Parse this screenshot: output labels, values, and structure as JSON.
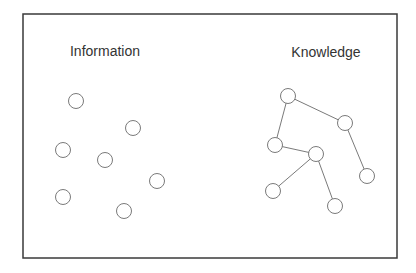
{
  "colors": {
    "frame": "#3a3a3a",
    "node": "#7a7a7a",
    "edge": "#7a7a7a",
    "text": "#333333"
  },
  "panels": {
    "information": {
      "label": "Information",
      "nodes": [
        [
          76,
          101
        ],
        [
          133,
          128
        ],
        [
          63,
          150
        ],
        [
          105,
          160
        ],
        [
          157,
          181
        ],
        [
          63,
          197
        ],
        [
          124,
          211
        ]
      ]
    },
    "knowledge": {
      "label": "Knowledge",
      "nodes": [
        [
          288,
          96
        ],
        [
          345,
          123
        ],
        [
          275,
          145
        ],
        [
          316,
          154
        ],
        [
          367,
          176
        ],
        [
          273,
          191
        ],
        [
          335,
          206
        ]
      ],
      "edges": [
        [
          0,
          1
        ],
        [
          0,
          2
        ],
        [
          1,
          4
        ],
        [
          2,
          3
        ],
        [
          3,
          5
        ],
        [
          3,
          6
        ]
      ]
    }
  }
}
